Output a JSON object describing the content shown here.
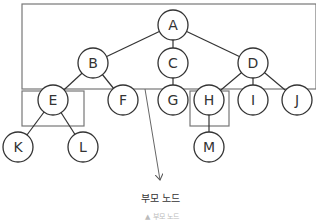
{
  "diagram": {
    "type": "tree",
    "nodes": [
      {
        "id": "A",
        "label": "A",
        "x": 173,
        "y": 25
      },
      {
        "id": "B",
        "label": "B",
        "x": 93,
        "y": 63
      },
      {
        "id": "C",
        "label": "C",
        "x": 173,
        "y": 63
      },
      {
        "id": "D",
        "label": "D",
        "x": 253,
        "y": 63
      },
      {
        "id": "E",
        "label": "E",
        "x": 53,
        "y": 100
      },
      {
        "id": "F",
        "label": "F",
        "x": 123,
        "y": 100
      },
      {
        "id": "G",
        "label": "G",
        "x": 173,
        "y": 100
      },
      {
        "id": "H",
        "label": "H",
        "x": 209,
        "y": 100
      },
      {
        "id": "I",
        "label": "I",
        "x": 253,
        "y": 100
      },
      {
        "id": "J",
        "label": "J",
        "x": 297,
        "y": 100
      },
      {
        "id": "K",
        "label": "K",
        "x": 18,
        "y": 147
      },
      {
        "id": "L",
        "label": "L",
        "x": 83,
        "y": 147
      },
      {
        "id": "M",
        "label": "M",
        "x": 209,
        "y": 147
      }
    ],
    "edges": [
      [
        "A",
        "B"
      ],
      [
        "A",
        "C"
      ],
      [
        "A",
        "D"
      ],
      [
        "B",
        "E"
      ],
      [
        "B",
        "F"
      ],
      [
        "C",
        "G"
      ],
      [
        "D",
        "H"
      ],
      [
        "D",
        "I"
      ],
      [
        "D",
        "J"
      ],
      [
        "E",
        "K"
      ],
      [
        "E",
        "L"
      ],
      [
        "H",
        "M"
      ]
    ],
    "highlight_boxes": [
      {
        "name": "parent-nodes-box",
        "x": 22,
        "y": 4,
        "w": 294,
        "h": 85
      },
      {
        "name": "node-e-box",
        "x": 22,
        "y": 91,
        "w": 62,
        "h": 35
      },
      {
        "name": "node-h-box",
        "x": 190,
        "y": 91,
        "w": 39,
        "h": 35
      }
    ],
    "callout": {
      "label": "부모 노드",
      "from": [
        145,
        89
      ],
      "to": [
        160,
        180
      ]
    },
    "caption": "▲ 부모 노드"
  }
}
